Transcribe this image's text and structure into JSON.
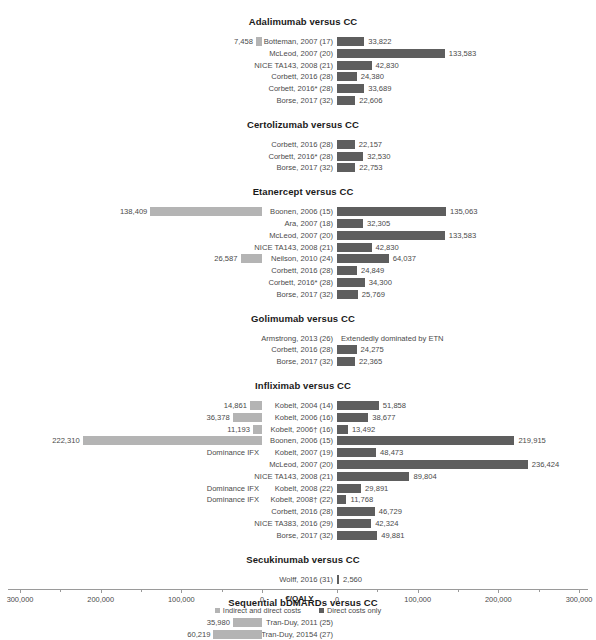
{
  "chart_data": {
    "type": "bar",
    "title": "",
    "xlabel": "€/QALY",
    "ylabel": "",
    "orientation": "horizontal",
    "layout": "diverging-mirrored-axis",
    "xlim_left": [
      0,
      300000
    ],
    "xlim_right": [
      0,
      300000
    ],
    "grid": false,
    "legend_position": "bottom-center",
    "tick_labels_left": [
      "300,000",
      "200,000",
      "100,000",
      "0"
    ],
    "tick_labels_right": [
      "0",
      "100,000",
      "200,000",
      "300,000"
    ],
    "legend": [
      {
        "name": "Indirect and direct costs",
        "color": "#b4b4b4"
      },
      {
        "name": "Direct costs only",
        "color": "#5e5e5e"
      }
    ],
    "series": [
      {
        "name": "Indirect and direct costs",
        "side": "left",
        "color": "#b4b4b4"
      },
      {
        "name": "Direct costs only",
        "side": "right",
        "color": "#5e5e5e"
      }
    ],
    "groups": [
      {
        "title": "Adalimumab versus CC",
        "rows": [
          {
            "label": "Botteman, 2007 (17)",
            "left": 7458,
            "left_text": "7,458",
            "right": 33822,
            "right_text": "33,822"
          },
          {
            "label": "McLeod, 2007 (20)",
            "left": null,
            "left_text": "",
            "right": 133583,
            "right_text": "133,583"
          },
          {
            "label": "NICE TA143, 2008 (21)",
            "left": null,
            "left_text": "",
            "right": 42830,
            "right_text": "42,830"
          },
          {
            "label": "Corbett, 2016 (28)",
            "left": null,
            "left_text": "",
            "right": 24380,
            "right_text": "24,380"
          },
          {
            "label": "Corbett, 2016* (28)",
            "left": null,
            "left_text": "",
            "right": 33689,
            "right_text": "33,689"
          },
          {
            "label": "Borse, 2017 (32)",
            "left": null,
            "left_text": "",
            "right": 22606,
            "right_text": "22,606"
          }
        ]
      },
      {
        "title": "Certolizumab versus CC",
        "rows": [
          {
            "label": "Corbett, 2016 (28)",
            "left": null,
            "left_text": "",
            "right": 22157,
            "right_text": "22,157"
          },
          {
            "label": "Corbett, 2016* (28)",
            "left": null,
            "left_text": "",
            "right": 32530,
            "right_text": "32,530"
          },
          {
            "label": "Borse, 2017 (32)",
            "left": null,
            "left_text": "",
            "right": 22753,
            "right_text": "22,753"
          }
        ]
      },
      {
        "title": "Etanercept versus CC",
        "rows": [
          {
            "label": "Boonen, 2006 (15)",
            "left": 138409,
            "left_text": "138,409",
            "right": 135063,
            "right_text": "135,063"
          },
          {
            "label": "Ara, 2007 (18)",
            "left": null,
            "left_text": "",
            "right": 32305,
            "right_text": "32,305"
          },
          {
            "label": "McLeod, 2007 (20)",
            "left": null,
            "left_text": "",
            "right": 133583,
            "right_text": "133,583"
          },
          {
            "label": "NICE TA143, 2008 (21)",
            "left": null,
            "left_text": "",
            "right": 42830,
            "right_text": "42,830"
          },
          {
            "label": "Neilson, 2010 (24)",
            "left": 26587,
            "left_text": "26,587",
            "right": 64037,
            "right_text": "64,037"
          },
          {
            "label": "Corbett, 2016 (28)",
            "left": null,
            "left_text": "",
            "right": 24849,
            "right_text": "24,849"
          },
          {
            "label": "Corbett, 2016* (28)",
            "left": null,
            "left_text": "",
            "right": 34300,
            "right_text": "34,300"
          },
          {
            "label": "Borse, 2017 (32)",
            "left": null,
            "left_text": "",
            "right": 25769,
            "right_text": "25,769"
          }
        ]
      },
      {
        "title": "Golimumab versus CC",
        "rows": [
          {
            "label": "Armstrong, 2013 (26)",
            "left": null,
            "left_text": "",
            "right": null,
            "right_text": "Extendedly dominated by ETN"
          },
          {
            "label": "Corbett, 2016 (28)",
            "left": null,
            "left_text": "",
            "right": 24275,
            "right_text": "24,275"
          },
          {
            "label": "Borse, 2017 (32)",
            "left": null,
            "left_text": "",
            "right": 22365,
            "right_text": "22,365"
          }
        ]
      },
      {
        "title": "Infliximab versus CC",
        "rows": [
          {
            "label": "Kobelt, 2004 (14)",
            "left": 14861,
            "left_text": "14,861",
            "right": 51858,
            "right_text": "51,858"
          },
          {
            "label": "Kobelt, 2006 (16)",
            "left": 36378,
            "left_text": "36,378",
            "right": 38677,
            "right_text": "38,677"
          },
          {
            "label": "Kobelt, 2006† (16)",
            "left": 11193,
            "left_text": "11,193",
            "right": 13492,
            "right_text": "13,492"
          },
          {
            "label": "Boonen, 2006 (15)",
            "left": 222310,
            "left_text": "222,310",
            "right": 219915,
            "right_text": "219,915"
          },
          {
            "label": "Kobelt, 2007 (19)",
            "left": null,
            "left_text": "Dominance IFX",
            "right": 48473,
            "right_text": "48,473"
          },
          {
            "label": "McLeod, 2007 (20)",
            "left": null,
            "left_text": "",
            "right": 236424,
            "right_text": "236,424"
          },
          {
            "label": "NICE TA143, 2008 (21)",
            "left": null,
            "left_text": "",
            "right": 89804,
            "right_text": "89,804"
          },
          {
            "label": "Kobelt, 2008 (22)",
            "left": null,
            "left_text": "Dominance IFX",
            "right": 29891,
            "right_text": "29,891"
          },
          {
            "label": "Kobelt, 2008† (22)",
            "left": null,
            "left_text": "Dominance IFX",
            "right": 11768,
            "right_text": "11,768"
          },
          {
            "label": "Corbett, 2016 (28)",
            "left": null,
            "left_text": "",
            "right": 46729,
            "right_text": "46,729"
          },
          {
            "label": "NICE TA383, 2016 (29)",
            "left": null,
            "left_text": "",
            "right": 42324,
            "right_text": "42,324"
          },
          {
            "label": "Borse, 2017 (32)",
            "left": null,
            "left_text": "",
            "right": 49881,
            "right_text": "49,881"
          }
        ]
      },
      {
        "title": "Secukinumab versus CC",
        "rows": [
          {
            "label": "Wolff, 2016 (31)",
            "left": null,
            "left_text": "",
            "right": 2560,
            "right_text": "2,560"
          }
        ]
      },
      {
        "title": "Sequential bDMARDs versus CC",
        "rows": [
          {
            "label": "Tran-Duy, 2011 (25)",
            "left": 35980,
            "left_text": "35,980",
            "right": null,
            "right_text": ""
          },
          {
            "label": "Tran-Duy, 20154 (27)",
            "left": 60219,
            "left_text": "60,219",
            "right": null,
            "right_text": ""
          }
        ]
      }
    ]
  }
}
